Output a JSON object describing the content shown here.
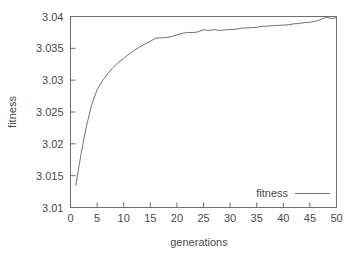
{
  "chart_data": {
    "type": "line",
    "title": "",
    "xlabel": "generations",
    "ylabel": "fitness",
    "xlim": [
      0,
      50
    ],
    "ylim": [
      3.01,
      3.04
    ],
    "xticks": [
      0,
      5,
      10,
      15,
      20,
      25,
      30,
      35,
      40,
      45,
      50
    ],
    "xtick_labels": [
      "0",
      "5",
      "10",
      "15",
      "20",
      "25",
      "30",
      "35",
      "40",
      "45",
      "50"
    ],
    "yticks": [
      3.01,
      3.015,
      3.02,
      3.025,
      3.03,
      3.035,
      3.04
    ],
    "ytick_labels": [
      "3.01",
      "3.015",
      "3.02",
      "3.025",
      "3.03",
      "3.035",
      "3.04"
    ],
    "grid": false,
    "legend_position": "bottom-right",
    "legend_entries": [
      "fitness"
    ],
    "line_color": "#707070",
    "background_color": "#ffffff",
    "axis_color": "#6e6e6e",
    "series": [
      {
        "name": "fitness",
        "x": [
          1,
          2,
          3,
          4,
          5,
          6,
          7,
          8,
          9,
          10,
          11,
          12,
          13,
          14,
          15,
          16,
          17,
          18,
          19,
          20,
          21,
          22,
          23,
          24,
          25,
          26,
          27,
          28,
          29,
          30,
          31,
          32,
          33,
          34,
          35,
          36,
          37,
          38,
          39,
          40,
          41,
          42,
          43,
          44,
          45,
          46,
          47,
          48,
          49,
          50
        ],
        "values": [
          3.0135,
          3.0185,
          3.0228,
          3.0262,
          3.0285,
          3.0299,
          3.031,
          3.032,
          3.0328,
          3.0334,
          3.0341,
          3.0347,
          3.0352,
          3.0357,
          3.0361,
          3.0366,
          3.03665,
          3.0367,
          3.03685,
          3.0371,
          3.03735,
          3.0375,
          3.03745,
          3.0376,
          3.0379,
          3.0378,
          3.03795,
          3.0378,
          3.0379,
          3.03795,
          3.038,
          3.03815,
          3.0382,
          3.03825,
          3.0383,
          3.03845,
          3.0385,
          3.03855,
          3.0386,
          3.03865,
          3.0387,
          3.03885,
          3.0389,
          3.03905,
          3.0391,
          3.03925,
          3.0395,
          3.0399,
          3.0397,
          3.0398
        ]
      }
    ]
  },
  "legend": {
    "entry_label": "fitness"
  },
  "axes": {
    "x_title": "generations",
    "y_title": "fitness"
  }
}
